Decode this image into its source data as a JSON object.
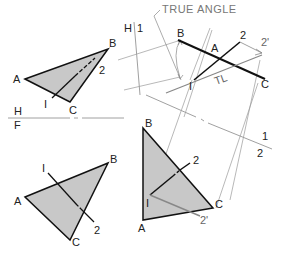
{
  "title": "TRUE ANGLE",
  "colors": {
    "fill": "#c8c8c8",
    "edge": "#111111",
    "construction": "#888888",
    "label": "#222222"
  },
  "fold_lines": {
    "hf": {
      "upper": "H",
      "lower": "F"
    },
    "h1": {
      "left": "H",
      "right": "1"
    },
    "one_two": {
      "upper": "1",
      "lower": "2"
    }
  },
  "views": {
    "top": {
      "name": "Horizontal view",
      "vertices": {
        "A": "A",
        "B": "B",
        "C": "C"
      },
      "line_points": {
        "p1": "I",
        "p2": "2"
      }
    },
    "front": {
      "name": "Frontal view",
      "vertices": {
        "A": "A",
        "B": "B",
        "C": "C"
      },
      "line_points": {
        "p1": "I",
        "p2": "2"
      }
    },
    "aux1": {
      "name": "Auxiliary view 1 (edge view)",
      "vertices": {
        "A": "A",
        "B": "B",
        "C": "C"
      },
      "line_points": {
        "p1": "I",
        "p2": "2",
        "p2prime": "2'"
      },
      "true_length": "TL"
    },
    "aux2": {
      "name": "Auxiliary view 2 (true size)",
      "vertices": {
        "A": "A",
        "B": "B",
        "C": "C"
      },
      "line_points": {
        "p1": "I",
        "p2": "2",
        "p2prime": "2'"
      }
    }
  }
}
